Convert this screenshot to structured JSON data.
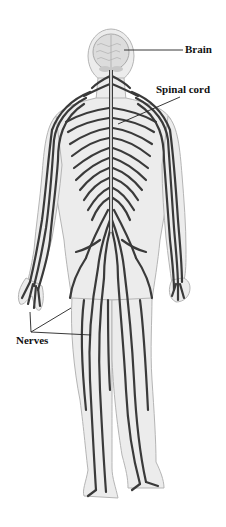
{
  "figure": {
    "labels": {
      "brain": "Brain",
      "spinal_cord": "Spinal cord",
      "nerves": "Nerves"
    },
    "colors": {
      "background": "#ffffff",
      "body_fill": "#ececec",
      "body_outline": "#b5b5b5",
      "nerve": "#3a3a3a",
      "brain_fill": "#dcdcdc",
      "spinal_cord": "#f4f4f4",
      "leader_line": "#222222",
      "label_text": "#111111"
    }
  }
}
